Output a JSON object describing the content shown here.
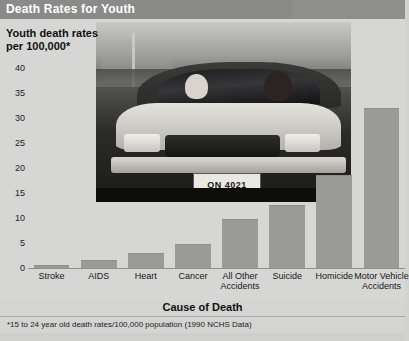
{
  "header": {
    "title": "Death Rates for Youth"
  },
  "chart_data": {
    "type": "bar",
    "title": "Death Rates for Youth",
    "ylabel": "Youth death rates per 100,000*",
    "ylabel_line1": "Youth death rates",
    "ylabel_line2": "per 100,000*",
    "xlabel": "Cause of Death",
    "categories": [
      "Stroke",
      "AIDS",
      "Heart",
      "Cancer",
      "All Other Accidents",
      "Suicide",
      "Homicide",
      "Motor Vehicle Accidents"
    ],
    "values": [
      0.6,
      1.6,
      3.0,
      4.8,
      9.8,
      12.6,
      18.6,
      32.0
    ],
    "ylim": [
      0,
      42
    ],
    "yticks": [
      0,
      5,
      10,
      15,
      20,
      25,
      30,
      35,
      40
    ],
    "ytick_labels": [
      "0",
      "5",
      "10",
      "15",
      "20",
      "25",
      "30",
      "35",
      "40"
    ],
    "grid": false,
    "legend": "none",
    "bar_color": "#9a9a97",
    "footnote": "*15 to 24 year old death rates/100,000 population (1990 NCHS Data)"
  },
  "photo": {
    "alt": "black-and-white photo of two young people in a car",
    "license_plate": "ON 4021"
  },
  "footnote": "*15 to 24 year old death rates/100,000 population (1990 NCHS Data)",
  "colors": {
    "title_bar": "#8a8a88",
    "background": "#d4d4d2",
    "bar": "#9a9a97",
    "text": "#171717"
  }
}
